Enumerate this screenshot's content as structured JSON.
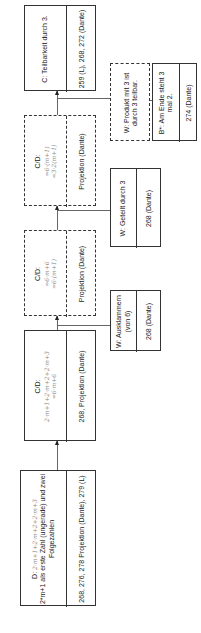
{
  "diagram": {
    "orientation": "rotated-90-ccw",
    "nodes": [
      {
        "id": "d",
        "style": "solid",
        "title": "D:",
        "handwriting": "2·m+1+2·m+2+2·m+3",
        "text": "2*m+1 als erste Zahl (ungerade) und zwei Folgezahlen",
        "ref": "268, 276, 278 Projektion (Dante), 279 (L)"
      },
      {
        "id": "cd1",
        "style": "solid",
        "title": "C/D:",
        "handwriting_1": "2·m+1+2·m+2+2·m+3",
        "handwriting_2": "=6·m+6",
        "ref": "268, Projektion (Dante)"
      },
      {
        "id": "cd2",
        "style": "dashed",
        "title": "C/D:",
        "handwriting_1": "=6·m+6",
        "handwriting_2": "=6·(m+1)",
        "ref": "Projektion (Dante)"
      },
      {
        "id": "cd3",
        "style": "dashed",
        "title": "C/D:",
        "handwriting_1": "=6·(m+1)",
        "handwriting_2": "=3·2(m+1)",
        "ref": "Projektion (Dante)"
      },
      {
        "id": "c",
        "style": "solid",
        "title": "C: Teilbarkeit durch 3.",
        "ref": "259 (L), 268, 272 (Dante)"
      }
    ],
    "side_nodes": [
      {
        "id": "w1",
        "style": "solid",
        "title": "W: Ausklammern (von 6)",
        "ref": "268 (Dante)"
      },
      {
        "id": "w2",
        "style": "solid",
        "title": "W: Geteilt durch 3",
        "ref": "268 (Dante)"
      },
      {
        "id": "w3",
        "style": "dashed",
        "title": "W: Produkt mit 3 ist durch 3 teilbar."
      },
      {
        "id": "b1",
        "style": "solid",
        "title": "B*: Am Ende steht 3 mal 2.",
        "ref": "274 (Dante)"
      }
    ]
  }
}
